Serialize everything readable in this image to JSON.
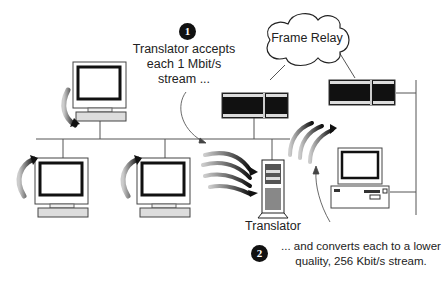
{
  "diagram": {
    "type": "network-diagram",
    "step1": {
      "number": "1",
      "line1": "Translator accepts",
      "line2": "each 1 Mbit/s",
      "line3": "stream ..."
    },
    "step2": {
      "number": "2",
      "line1": "... and converts each to a lower",
      "line2": "quality, 256 Kbit/s stream."
    },
    "cloud_label": "Frame Relay",
    "translator_label": "Translator",
    "colors": {
      "line": "#555555",
      "arrow_dark": "#111111",
      "arrow_light": "#bbbbbb",
      "device_fill": "#111111",
      "background": "#ffffff"
    },
    "nodes": [
      {
        "id": "workstation-top-left",
        "kind": "workstation"
      },
      {
        "id": "workstation-bottom-left",
        "kind": "workstation"
      },
      {
        "id": "workstation-bottom-middle",
        "kind": "workstation"
      },
      {
        "id": "router-left",
        "kind": "router"
      },
      {
        "id": "router-right",
        "kind": "router"
      },
      {
        "id": "translator-server",
        "kind": "tower-server"
      },
      {
        "id": "desktop-right",
        "kind": "desktop-pc"
      },
      {
        "id": "frame-relay-cloud",
        "kind": "cloud"
      }
    ]
  }
}
